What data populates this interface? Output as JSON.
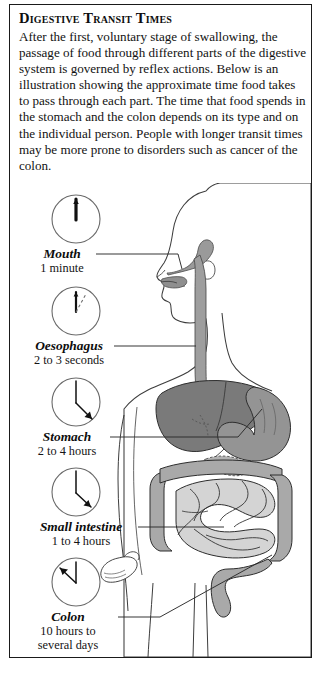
{
  "panel": {
    "title": "Digestive Transit Times",
    "intro": "After the first, voluntary stage of swallowing, the passage of food through different parts of the digestive system is governed by reflex actions. Below is an illustration showing the approximate time food takes to pass through each part. The time that food spends in the stomach and the colon depends on its type and on the individual person. People with longer transit times may be more prone to disorders such as cancer of the colon."
  },
  "labels": [
    {
      "name": "Mouth",
      "time": "1 minute"
    },
    {
      "name": "Oesophagus",
      "time": "2 to 3 seconds"
    },
    {
      "name": "Stomach",
      "time": "2 to 4 hours"
    },
    {
      "name": "Small intestine",
      "time": "1 to 4 hours"
    },
    {
      "name": "Colon",
      "time_line1": "10 hours to",
      "time_line2": "several days"
    }
  ],
  "colors": {
    "frame": "#1a1a1a",
    "ink": "#111111",
    "leader_line": "#2a2a2a",
    "body_outline": "#3a3a3a",
    "liver": "#767676",
    "stomach": "#8f8f8f",
    "colon": "#a8a8a8",
    "small_intestine": "#cfcfcf",
    "oesophagus": "#999999",
    "background": "#ffffff"
  }
}
